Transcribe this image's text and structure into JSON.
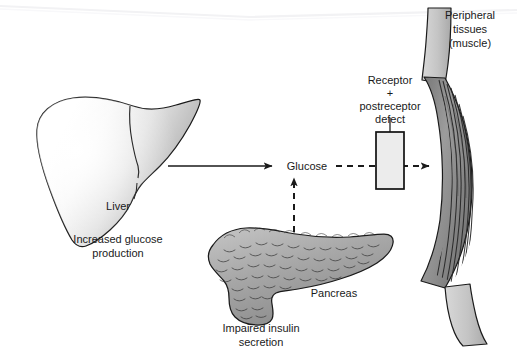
{
  "figure": {
    "width": 517,
    "height": 352,
    "background": "#ffffff"
  },
  "organs": {
    "liver": {
      "name": "Liver",
      "label": "Liver",
      "caption_line1": "Increased glucose",
      "caption_line2": "production",
      "fill_light": "#fbfbfb",
      "fill_dark": "#9e9e9e",
      "outline": "#1a1a1a"
    },
    "pancreas": {
      "name": "Pancreas",
      "label": "Pancreas",
      "caption_line1": "Impaired insulin",
      "caption_line2": "secretion",
      "fill_light": "#b4b4b4",
      "fill_dark": "#8a8a8a",
      "outline": "#1a1a1a"
    },
    "muscle": {
      "name": "Peripheral tissues (muscle)",
      "label_line1": "Peripheral",
      "label_line2": "tissues",
      "label_line3": "(muscle)",
      "tendon_fill": "#c6c6c6",
      "belly_fill": "#8d8d8d",
      "striation_color": "#2a2a2a",
      "outline": "#1a1a1a"
    }
  },
  "nodes": {
    "glucose": {
      "label": "Glucose",
      "x": 307,
      "y": 170
    },
    "receptor_box": {
      "label_line1": "Receptor",
      "label_line2": "+",
      "label_line3": "postreceptor",
      "label_line4": "defect",
      "fill": "#ececec",
      "outline": "#111111",
      "x": 376,
      "y": 132,
      "width": 28,
      "height": 57
    }
  },
  "arrows": {
    "liver_to_glucose": {
      "name": "Increased glucose production to glucose",
      "style": "solid",
      "color": "#1a1a1a"
    },
    "pancreas_to_glucose": {
      "name": "Impaired insulin secretion to glucose",
      "style": "dashed",
      "color": "#1a1a1a"
    },
    "glucose_to_muscle": {
      "name": "Glucose uptake into peripheral tissues",
      "style": "dashed",
      "color": "#1a1a1a"
    }
  }
}
